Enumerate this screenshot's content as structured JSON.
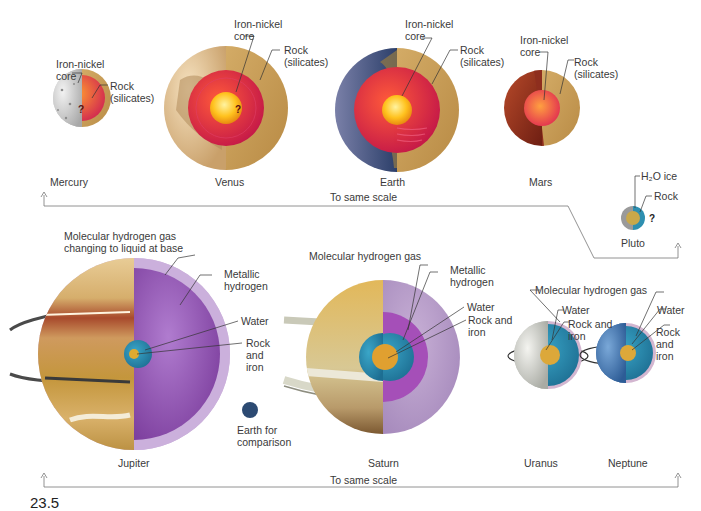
{
  "figure": {
    "figure_number_partial": "23.5",
    "terrestrial_row": {
      "scale_label": "To same scale",
      "planets": [
        {
          "name": "Mercury",
          "labels": [
            "Iron-nickel\ncore",
            "Rock\n(silicates)"
          ],
          "question_mark": "?"
        },
        {
          "name": "Venus",
          "labels": [
            "Iron-nickel\ncore",
            "Rock\n(silicates)"
          ],
          "question_mark": "?"
        },
        {
          "name": "Earth",
          "labels": [
            "Iron-nickel\ncore",
            "Rock\n(silicates)"
          ]
        },
        {
          "name": "Mars",
          "labels": [
            "Iron-nickel\ncore",
            "Rock\n(silicates)"
          ]
        }
      ]
    },
    "pluto": {
      "name": "Pluto",
      "labels": [
        "H₂O ice",
        "Rock"
      ],
      "question_mark": "?"
    },
    "jovian_row": {
      "scale_label": "To same scale",
      "planets": [
        {
          "name": "Jupiter",
          "labels": [
            "Molecular hydrogen gas\nchanging to liquid at base",
            "Metallic\nhydrogen",
            "Water",
            "Rock\nand\niron"
          ]
        },
        {
          "name": "Saturn",
          "labels": [
            "Molecular hydrogen gas",
            "Metallic\nhydrogen",
            "Water",
            "Rock and\niron"
          ]
        },
        {
          "name": "Uranus",
          "labels": [
            "Water",
            "Rock and\niron"
          ]
        },
        {
          "name": "Neptune",
          "labels": [
            "Water",
            "Rock\nand\niron"
          ]
        }
      ],
      "shared_label": "Molecular hydrogen gas",
      "earth_comparison": "Earth for\ncomparison"
    }
  },
  "colors": {
    "rock_mantle": "#c9a35c",
    "molten_core": "#d8284e",
    "inner_core": "#ffcc33",
    "metallic_hydrogen": "#9b59b6",
    "molecular_hydrogen": "#c9b2d6",
    "water": "#2e8fb0",
    "earth_dot": "#2c4a72"
  }
}
